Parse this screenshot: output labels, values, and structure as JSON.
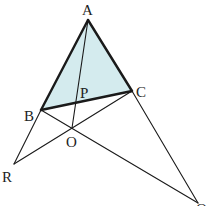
{
  "diagram": {
    "type": "geometry",
    "fill_color": "#d4ebee",
    "line_color": "#1a1a1a",
    "points": {
      "A": {
        "label": "A",
        "x": 88,
        "y": 20,
        "lx": 82,
        "ly": 15
      },
      "B": {
        "label": "B",
        "x": 41,
        "y": 110,
        "lx": 24,
        "ly": 121
      },
      "C": {
        "label": "C",
        "x": 132,
        "y": 91,
        "lx": 136,
        "ly": 97
      },
      "P": {
        "label": "P",
        "x": 77,
        "y": 103,
        "lx": 80,
        "ly": 98
      },
      "O": {
        "label": "O",
        "x": 72,
        "y": 128,
        "lx": 66,
        "ly": 147
      },
      "R": {
        "label": "R",
        "x": 14,
        "y": 164,
        "lx": 2,
        "ly": 182
      },
      "Q": {
        "label": "Q",
        "x": 198,
        "y": 203,
        "lx": 196,
        "ly": 214
      }
    },
    "shaded_triangle": [
      "A",
      "B",
      "C"
    ],
    "segments": [
      {
        "from": "A",
        "to": "B",
        "weight": "thick"
      },
      {
        "from": "A",
        "to": "C",
        "weight": "thick"
      },
      {
        "from": "B",
        "to": "C",
        "weight": "thick"
      },
      {
        "from": "A",
        "to": "O",
        "weight": "thin"
      },
      {
        "from": "B",
        "to": "R",
        "weight": "thin"
      },
      {
        "from": "R",
        "to": "C",
        "weight": "thin"
      },
      {
        "from": "B",
        "to": "Q",
        "weight": "thin"
      },
      {
        "from": "C",
        "to": "Q",
        "weight": "thin"
      }
    ]
  }
}
